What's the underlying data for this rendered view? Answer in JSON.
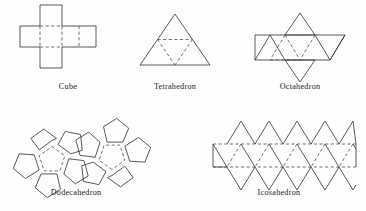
{
  "figure": {
    "background_color": "#ffffff",
    "solid_line_color": "#3b3b3b",
    "dashed_line_color": "#5a5a5a"
  },
  "solids": [
    {
      "id": "cube",
      "label": "Cube",
      "faces": 6,
      "face_shape": "square",
      "net_description": "cross-shaped net of six squares",
      "caption": {
        "x": 38,
        "y": 82,
        "width": 60
      }
    },
    {
      "id": "tetrahedron",
      "label": "Tetrahedron",
      "faces": 4,
      "face_shape": "triangle",
      "net_description": "large triangle divided into four smaller triangles",
      "caption": {
        "x": 137,
        "y": 82,
        "width": 76
      }
    },
    {
      "id": "octahedron",
      "label": "Octahedron",
      "faces": 8,
      "face_shape": "triangle",
      "net_description": "band of six triangles with one triangle above and one below",
      "caption": {
        "x": 262,
        "y": 82,
        "width": 76
      }
    },
    {
      "id": "dodecahedron",
      "label": "Dodecahedron",
      "faces": 12,
      "face_shape": "pentagon",
      "net_description": "two pentagon rosettes joined edge to edge",
      "caption": {
        "x": 28,
        "y": 188,
        "width": 96
      }
    },
    {
      "id": "icosahedron",
      "label": "Icosahedron",
      "faces": 20,
      "face_shape": "triangle",
      "net_description": "zigzag strip of twenty triangles in two rows",
      "caption": {
        "x": 236,
        "y": 188,
        "width": 86
      }
    }
  ]
}
